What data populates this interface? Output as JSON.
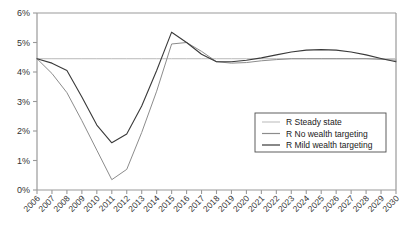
{
  "chart_data": {
    "type": "line",
    "title": "",
    "subtitle": "",
    "xlabel": "",
    "ylabel": "",
    "grid": false,
    "legend_position": "inside-bottom-right",
    "xlim": [
      2006,
      2030
    ],
    "ylim": [
      0,
      6
    ],
    "x": [
      2006,
      2007,
      2008,
      2009,
      2010,
      2011,
      2012,
      2013,
      2014,
      2015,
      2016,
      2017,
      2018,
      2019,
      2020,
      2021,
      2022,
      2023,
      2024,
      2025,
      2026,
      2027,
      2028,
      2029,
      2030
    ],
    "xtick_labels": [
      "2006",
      "2007",
      "2008",
      "2009",
      "2010",
      "2011",
      "2012",
      "2013",
      "2014",
      "2015",
      "2016",
      "2017",
      "2018",
      "2019",
      "2020",
      "2021",
      "2022",
      "2023",
      "2024",
      "2025",
      "2026",
      "2027",
      "2028",
      "2029",
      "2030"
    ],
    "ytick_values": [
      0,
      1,
      2,
      3,
      4,
      5,
      6
    ],
    "ytick_labels": [
      "0%",
      "1%",
      "2%",
      "3%",
      "4%",
      "5%",
      "6%"
    ],
    "series": [
      {
        "name": "R Steady state",
        "color": "#b9b9b9",
        "width": 1.0,
        "values": [
          4.45,
          4.45,
          4.45,
          4.45,
          4.45,
          4.45,
          4.45,
          4.45,
          4.45,
          4.45,
          4.45,
          4.45,
          4.45,
          4.45,
          4.45,
          4.45,
          4.45,
          4.45,
          4.45,
          4.45,
          4.45,
          4.45,
          4.45,
          4.45,
          4.45
        ]
      },
      {
        "name": "R No wealth targeting",
        "color": "#8c8c8c",
        "width": 1.0,
        "values": [
          4.45,
          3.95,
          3.3,
          2.35,
          1.35,
          0.35,
          0.7,
          1.95,
          3.35,
          4.95,
          5.0,
          4.7,
          4.35,
          4.3,
          4.32,
          4.38,
          4.42,
          4.45,
          4.45,
          4.45,
          4.45,
          4.45,
          4.45,
          4.43,
          4.4
        ]
      },
      {
        "name": "R Mild wealth targeting",
        "color": "#3a3a3a",
        "width": 1.1,
        "values": [
          4.45,
          4.3,
          4.05,
          3.15,
          2.2,
          1.6,
          1.9,
          2.85,
          4.05,
          5.35,
          5.0,
          4.6,
          4.35,
          4.35,
          4.4,
          4.48,
          4.58,
          4.68,
          4.74,
          4.76,
          4.74,
          4.68,
          4.58,
          4.46,
          4.35
        ]
      }
    ]
  },
  "legend": {
    "items": [
      {
        "label": "R Steady state",
        "color": "#b9b9b9"
      },
      {
        "label": "R No wealth targeting",
        "color": "#8c8c8c"
      },
      {
        "label": "R Mild wealth targeting",
        "color": "#3a3a3a"
      }
    ]
  },
  "axes": {
    "axis_color": "#999999",
    "tick_color": "#999999"
  }
}
